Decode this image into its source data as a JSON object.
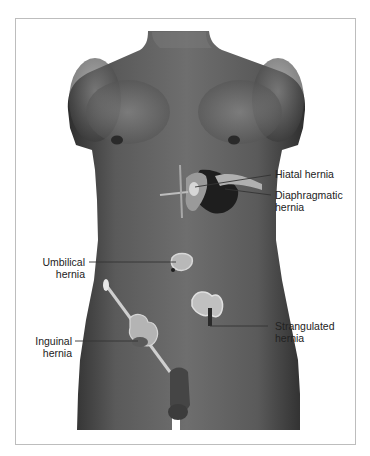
{
  "figure": {
    "colors": {
      "frame": "#bdbdbd",
      "skin_dark": "#3a3a3a",
      "skin_mid": "#6b6b6b",
      "skin_light": "#9a9a9a",
      "organ": "#c9c9c9",
      "leader": "#333333",
      "text": "#222222"
    }
  },
  "labels": {
    "hiatal": {
      "line1": "Hiatal hernia"
    },
    "diaphragmatic": {
      "line1": "Diaphragmatic",
      "line2": "hernia"
    },
    "umbilical": {
      "line1": "Umbilical",
      "line2": "hernia"
    },
    "strangulated": {
      "line1": "Strangulated",
      "line2": "hernia"
    },
    "inguinal": {
      "line1": "Inguinal",
      "line2": "hernia"
    }
  }
}
